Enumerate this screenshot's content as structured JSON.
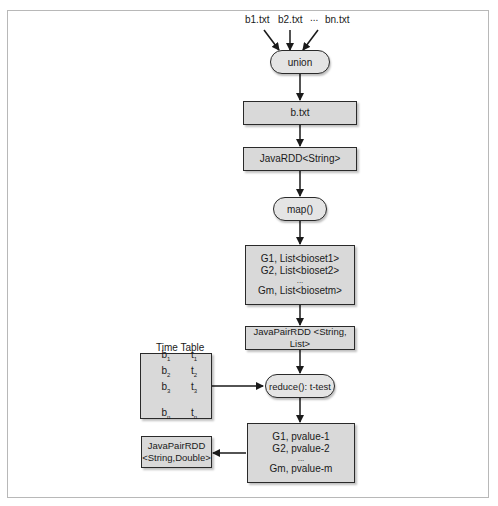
{
  "diagram": {
    "inputs": [
      "b1.txt",
      "b2.txt",
      "...",
      "bn.txt"
    ],
    "nodes": {
      "union": "union",
      "btxt": "b.txt",
      "javardd": "JavaRDD<String>",
      "map": "map()",
      "grouped": {
        "lines": [
          "G1, List<bioset1>",
          "G2, List<bioset2>",
          "...",
          "Gm, List<biosetm>"
        ]
      },
      "javapairrdd": "JavaPairRDD <String, List>",
      "reduce": "reduce(): t-test",
      "pvalues": {
        "lines": [
          "G1, pvalue-1",
          "G2, pvalue-2",
          "...",
          "Gm, pvalue-m"
        ]
      },
      "output": {
        "lines": [
          "JavaPairRDD",
          "<String,Double>"
        ]
      }
    },
    "time_table": {
      "title": "Time Table",
      "rows": [
        {
          "b": "b",
          "bsub": "1",
          "t": "t",
          "tsub": "1"
        },
        {
          "b": "b",
          "bsub": "2",
          "t": "t",
          "tsub": "2"
        },
        {
          "b": "b",
          "bsub": "3",
          "t": "t",
          "tsub": "3"
        },
        {
          "b": "b",
          "bsub": "n",
          "t": "t",
          "tsub": "n"
        }
      ]
    },
    "colors": {
      "box_fill": "#d9d9d9",
      "pill_fill": "#e4e4e4",
      "stroke": "#2a2a2a",
      "frame": "#b8b8b8"
    }
  }
}
